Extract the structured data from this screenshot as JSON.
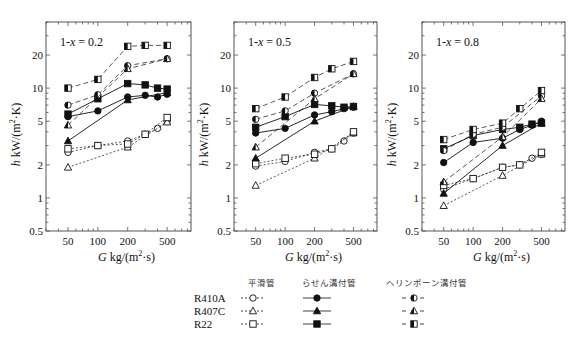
{
  "chart_data": [
    {
      "type": "line",
      "panel_label": "1-x = 0.2",
      "xlabel": "G  kg/(m²·s)",
      "ylabel": "h  kW/(m²·K)",
      "xscale": "log",
      "yscale": "log",
      "xlim": [
        30,
        870
      ],
      "ylim": [
        0.5,
        40
      ],
      "xticks": [
        50,
        100,
        200,
        500
      ],
      "yticks": [
        0.5,
        1,
        2,
        5,
        10,
        20
      ],
      "grid": false,
      "series": [
        {
          "name": "R410A 平滑管",
          "tube": "smooth",
          "refrigerant": "R410A",
          "marker": "circle-open",
          "line": "dotted",
          "x": [
            50,
            100,
            200,
            300,
            400,
            500
          ],
          "y": [
            2.6,
            3.0,
            3.3,
            3.8,
            4.3,
            5.0
          ]
        },
        {
          "name": "R407C 平滑管",
          "tube": "smooth",
          "refrigerant": "R407C",
          "marker": "triangle-open",
          "line": "dotted",
          "x": [
            50,
            200,
            500
          ],
          "y": [
            1.9,
            2.9,
            4.9
          ]
        },
        {
          "name": "R22 平滑管",
          "tube": "smooth",
          "refrigerant": "R22",
          "marker": "square-open",
          "line": "dotted",
          "x": [
            50,
            100,
            200,
            300,
            500
          ],
          "y": [
            2.8,
            3.0,
            3.1,
            3.8,
            5.4
          ]
        },
        {
          "name": "R410A らせん溝付管",
          "tube": "spiral",
          "refrigerant": "R410A",
          "marker": "circle-filled",
          "line": "solid",
          "x": [
            50,
            100,
            200,
            300,
            400,
            500
          ],
          "y": [
            5.5,
            6.2,
            8.3,
            8.6,
            8.3,
            8.8
          ]
        },
        {
          "name": "R407C らせん溝付管",
          "tube": "spiral",
          "refrigerant": "R407C",
          "marker": "triangle-filled",
          "line": "solid",
          "x": [
            50,
            200,
            500
          ],
          "y": [
            3.3,
            7.8,
            9.1
          ]
        },
        {
          "name": "R22 らせん溝付管",
          "tube": "spiral",
          "refrigerant": "R22",
          "marker": "square-filled",
          "line": "solid",
          "x": [
            50,
            100,
            200,
            300,
            400,
            500
          ],
          "y": [
            5.8,
            8.0,
            11.0,
            10.7,
            10.0,
            9.8
          ]
        },
        {
          "name": "R410A ヘリンボーン溝付管",
          "tube": "herringbone",
          "refrigerant": "R410A",
          "marker": "circle-half",
          "line": "dashed",
          "x": [
            50,
            100,
            200,
            500
          ],
          "y": [
            7.0,
            8.7,
            16.0,
            18.5
          ]
        },
        {
          "name": "R407C ヘリンボーン溝付管",
          "tube": "herringbone",
          "refrigerant": "R407C",
          "marker": "triangle-half",
          "line": "dashed",
          "x": [
            50,
            200,
            500
          ],
          "y": [
            4.6,
            15.0,
            18.5
          ]
        },
        {
          "name": "R22 ヘリンボーン溝付管",
          "tube": "herringbone",
          "refrigerant": "R22",
          "marker": "square-half",
          "line": "dashed",
          "x": [
            50,
            100,
            200,
            300,
            500
          ],
          "y": [
            10.0,
            12.0,
            24.0,
            24.5,
            24.5
          ]
        }
      ]
    },
    {
      "type": "line",
      "panel_label": "1-x = 0.5",
      "xlabel": "G  kg/(m²·s)",
      "ylabel": "h  kW/(m²·K)",
      "xscale": "log",
      "yscale": "log",
      "xlim": [
        30,
        870
      ],
      "ylim": [
        0.5,
        40
      ],
      "xticks": [
        50,
        100,
        200,
        500
      ],
      "yticks": [
        0.5,
        1,
        2,
        5,
        10,
        20
      ],
      "grid": false,
      "series": [
        {
          "name": "R410A 平滑管",
          "tube": "smooth",
          "refrigerant": "R410A",
          "marker": "circle-open",
          "line": "dotted",
          "x": [
            50,
            100,
            200,
            300,
            400,
            500
          ],
          "y": [
            1.95,
            2.15,
            2.6,
            2.8,
            3.3,
            3.9
          ]
        },
        {
          "name": "R407C 平滑管",
          "tube": "smooth",
          "refrigerant": "R407C",
          "marker": "triangle-open",
          "line": "dotted",
          "x": [
            50,
            200,
            500
          ],
          "y": [
            1.3,
            2.3,
            3.9
          ]
        },
        {
          "name": "R22 平滑管",
          "tube": "smooth",
          "refrigerant": "R22",
          "marker": "square-open",
          "line": "dotted",
          "x": [
            50,
            100,
            200,
            300,
            500
          ],
          "y": [
            2.05,
            2.3,
            2.5,
            2.8,
            4.0
          ]
        },
        {
          "name": "R410A らせん溝付管",
          "tube": "spiral",
          "refrigerant": "R410A",
          "marker": "circle-filled",
          "line": "solid",
          "x": [
            50,
            100,
            200,
            300,
            400,
            500
          ],
          "y": [
            3.9,
            4.3,
            5.7,
            6.1,
            6.5,
            6.7
          ]
        },
        {
          "name": "R407C らせん溝付管",
          "tube": "spiral",
          "refrigerant": "R407C",
          "marker": "triangle-filled",
          "line": "solid",
          "x": [
            50,
            200,
            500
          ],
          "y": [
            2.3,
            5.0,
            6.8
          ]
        },
        {
          "name": "R22 らせん溝付管",
          "tube": "spiral",
          "refrigerant": "R22",
          "marker": "square-filled",
          "line": "solid",
          "x": [
            50,
            100,
            200,
            300,
            400,
            500
          ],
          "y": [
            4.4,
            5.5,
            7.1,
            6.9,
            6.7,
            6.8
          ]
        },
        {
          "name": "R410A ヘリンボーン溝付管",
          "tube": "herringbone",
          "refrigerant": "R410A",
          "marker": "circle-half",
          "line": "dashed",
          "x": [
            50,
            100,
            200,
            500
          ],
          "y": [
            5.2,
            6.2,
            9.0,
            13.5
          ]
        },
        {
          "name": "R407C ヘリンボーン溝付管",
          "tube": "herringbone",
          "refrigerant": "R407C",
          "marker": "triangle-half",
          "line": "dashed",
          "x": [
            50,
            200,
            500
          ],
          "y": [
            2.9,
            8.0,
            13.5
          ]
        },
        {
          "name": "R22 ヘリンボーン溝付管",
          "tube": "herringbone",
          "refrigerant": "R22",
          "marker": "square-half",
          "line": "dashed",
          "x": [
            50,
            100,
            200,
            300,
            500
          ],
          "y": [
            6.5,
            8.3,
            12.5,
            15.0,
            17.5
          ]
        }
      ]
    },
    {
      "type": "line",
      "panel_label": "1-x = 0.8",
      "xlabel": "G  kg/(m²·s)",
      "ylabel": "h  kW/(m²·K)",
      "xscale": "log",
      "yscale": "log",
      "xlim": [
        30,
        870
      ],
      "ylim": [
        0.5,
        40
      ],
      "xticks": [
        50,
        100,
        200,
        500
      ],
      "yticks": [
        0.5,
        1,
        2,
        5,
        10,
        20
      ],
      "grid": false,
      "series": [
        {
          "name": "R410A 平滑管",
          "tube": "smooth",
          "refrigerant": "R410A",
          "marker": "circle-open",
          "line": "dotted",
          "x": [
            50,
            100,
            200,
            300,
            400,
            500
          ],
          "y": [
            1.2,
            1.5,
            1.9,
            2.0,
            2.3,
            2.5
          ]
        },
        {
          "name": "R407C 平滑管",
          "tube": "smooth",
          "refrigerant": "R407C",
          "marker": "triangle-open",
          "line": "dotted",
          "x": [
            50,
            200,
            500
          ],
          "y": [
            0.85,
            1.6,
            2.5
          ]
        },
        {
          "name": "R22 平滑管",
          "tube": "smooth",
          "refrigerant": "R22",
          "marker": "square-open",
          "line": "dotted",
          "x": [
            50,
            100,
            200,
            300,
            500
          ],
          "y": [
            1.3,
            1.5,
            1.9,
            2.0,
            2.6
          ]
        },
        {
          "name": "R410A らせん溝付管",
          "tube": "spiral",
          "refrigerant": "R410A",
          "marker": "circle-filled",
          "line": "solid",
          "x": [
            50,
            100,
            200,
            300,
            400,
            500
          ],
          "y": [
            2.1,
            3.2,
            3.5,
            4.2,
            4.6,
            5.0
          ]
        },
        {
          "name": "R407C らせん溝付管",
          "tube": "spiral",
          "refrigerant": "R407C",
          "marker": "triangle-filled",
          "line": "solid",
          "x": [
            50,
            200,
            500
          ],
          "y": [
            1.1,
            3.0,
            4.8
          ]
        },
        {
          "name": "R22 らせん溝付管",
          "tube": "spiral",
          "refrigerant": "R22",
          "marker": "square-filled",
          "line": "solid",
          "x": [
            50,
            100,
            200,
            300,
            400,
            500
          ],
          "y": [
            2.8,
            3.7,
            4.2,
            4.4,
            4.7,
            4.8
          ]
        },
        {
          "name": "R410A ヘリンボーン溝付管",
          "tube": "herringbone",
          "refrigerant": "R410A",
          "marker": "circle-half",
          "line": "dashed",
          "x": [
            50,
            100,
            200,
            500
          ],
          "y": [
            2.7,
            3.8,
            4.4,
            8.5
          ]
        },
        {
          "name": "R407C ヘリンボーン溝付管",
          "tube": "herringbone",
          "refrigerant": "R407C",
          "marker": "triangle-half",
          "line": "dashed",
          "x": [
            50,
            200,
            500
          ],
          "y": [
            1.4,
            3.6,
            8.0
          ]
        },
        {
          "name": "R22 ヘリンボーン溝付管",
          "tube": "herringbone",
          "refrigerant": "R22",
          "marker": "square-half",
          "line": "dashed",
          "x": [
            50,
            100,
            200,
            300,
            500
          ],
          "y": [
            3.4,
            4.2,
            4.8,
            6.5,
            9.5
          ]
        }
      ]
    }
  ],
  "layout": {
    "panels_px": [
      {
        "left": 46,
        "right": 191,
        "top": 22,
        "bottom": 231
      },
      {
        "left": 234,
        "right": 377,
        "top": 22,
        "bottom": 231
      },
      {
        "left": 422,
        "right": 565,
        "top": 22,
        "bottom": 231
      }
    ]
  },
  "axis_labels": {
    "x_prefix": "G",
    "x_unit": "kg/(m",
    "x_sup": "2",
    "x_tail": "·s)",
    "y_prefix": "h",
    "y_unit": "kW/(m",
    "y_sup": "2",
    "y_tail": "·K)"
  },
  "legend": {
    "columns": [
      "平滑管",
      "らせん溝付管",
      "ヘリンボーン溝付管"
    ],
    "rows": [
      "R410A",
      "R407C",
      "R22"
    ]
  },
  "colors": {
    "ink": "#111111",
    "frame": "#555555",
    "background": "#ffffff"
  }
}
